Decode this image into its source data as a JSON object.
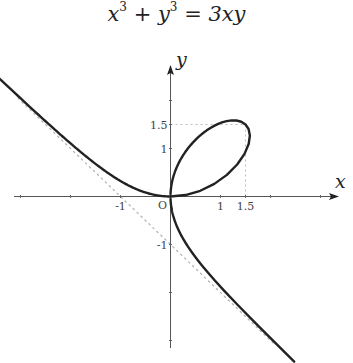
{
  "chart_data": {
    "type": "line",
    "title_parts": {
      "x": "x",
      "y": "y",
      "exp": "3",
      "plus": " + ",
      "rhs": " = 3xy"
    },
    "xlabel": "x",
    "ylabel": "y",
    "origin_label": "O",
    "xlim": [
      -3,
      3.3
    ],
    "ylim": [
      -3.1,
      2.7
    ],
    "grid": false,
    "legend": null,
    "curve": {
      "name": "Folium of Descartes",
      "equation": "x^3 + y^3 = 3xy",
      "parametric": {
        "x": "3t/(1+t^3)",
        "y": "3t^2/(1+t^3)"
      },
      "color": "#222222",
      "branches": [
        {
          "x_range": [
            -3.0,
            0
          ],
          "description": "left branch from upper-left approaching origin"
        },
        {
          "x_range": [
            0,
            1.5874
          ],
          "description": "loop through (1.5,1.5)"
        },
        {
          "x_range": [
            0,
            2.24
          ],
          "y_end": -3.12,
          "description": "lower branch from origin to lower-right"
        }
      ]
    },
    "asymptote": {
      "equation": "x + y + 1 = 0",
      "style": "dotted",
      "color": "#aaaaaa"
    },
    "guide_lines": [
      {
        "from": [
          0,
          1.5
        ],
        "to": [
          1.5,
          1.5
        ],
        "style": "dotted"
      },
      {
        "from": [
          1.5,
          1.5
        ],
        "to": [
          1.5,
          0
        ],
        "style": "dotted"
      }
    ],
    "x_ticks": [
      -3,
      -2,
      -1,
      1,
      1.5,
      2,
      3
    ],
    "x_tick_labels": [
      {
        "value": -1,
        "label": "-1"
      },
      {
        "value": 1,
        "label": "1"
      },
      {
        "value": 1.5,
        "label": "1.5"
      }
    ],
    "y_ticks": [
      -3,
      -2,
      -1,
      1,
      1.5,
      2
    ],
    "y_tick_labels": [
      {
        "value": 1.5,
        "label": "1.5"
      },
      {
        "value": 1,
        "label": "1"
      },
      {
        "value": -1,
        "label": "-1"
      }
    ],
    "key_points": [
      {
        "x": 0,
        "y": 0,
        "label": "O"
      },
      {
        "x": 1.5,
        "y": 1.5
      }
    ]
  },
  "layout": {
    "origin_px": [
      170.5,
      196.5
    ],
    "unit_x_px": 50,
    "unit_y_px": 48
  }
}
